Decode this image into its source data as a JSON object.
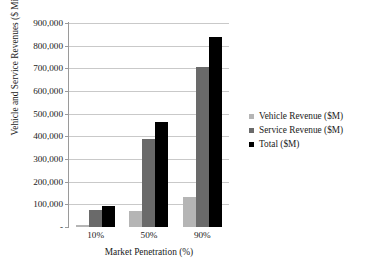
{
  "figure": {
    "cut_off_title": "Vehicle and Service Revenues",
    "legend_position": "right",
    "grid": "horizontal"
  },
  "colors": {
    "vehicle": "#b5b5b5",
    "service": "#6a6a6a",
    "total": "#000000",
    "gridline": "#c9c9c9",
    "axis": "#9a9a9a",
    "background": "#ffffff",
    "text": "#1a1a1a"
  },
  "chart_data": {
    "type": "bar",
    "title": "Vehicle and Service Revenues",
    "xlabel": "Market Penetration (%)",
    "ylabel": "Vehicle and Service Revenues ($ Million)",
    "categories": [
      "10%",
      "50%",
      "90%"
    ],
    "ylim": [
      0,
      900000
    ],
    "ytick_step": 100000,
    "ytick_labels": [
      "900,000",
      "800,000",
      "700,000",
      "600,000",
      "500,000",
      "400,000",
      "300,000",
      "200,000",
      "100,000",
      "-"
    ],
    "ytick_values": [
      900000,
      800000,
      700000,
      600000,
      500000,
      400000,
      300000,
      200000,
      100000,
      0
    ],
    "series": [
      {
        "name": "Vehicle Revenue ($M)",
        "color": "#b5b5b5",
        "values": [
          7000,
          70000,
          132000
        ]
      },
      {
        "name": "Service Revenue ($M)",
        "color": "#6a6a6a",
        "values": [
          75000,
          390000,
          705000
        ]
      },
      {
        "name": "Total ($M)",
        "color": "#000000",
        "values": [
          92000,
          465000,
          840000
        ]
      }
    ],
    "legend": [
      "Vehicle Revenue ($M)",
      "Service Revenue ($M)",
      "Total ($M)"
    ]
  }
}
